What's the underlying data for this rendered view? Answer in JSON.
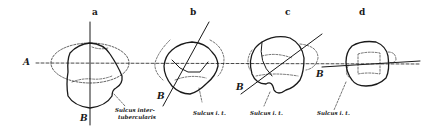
{
  "figure": {
    "panels": [
      {
        "id": "a",
        "label": "a",
        "annotation": "Sulcus inter-\ntubercularis",
        "annotation_lines": [
          "Sulcus inter-",
          "tubercularis"
        ]
      },
      {
        "id": "b",
        "label": "b",
        "annotation": "Sulcus i. t."
      },
      {
        "id": "c",
        "label": "c",
        "annotation": "Sulcus i. t."
      },
      {
        "id": "d",
        "label": "d",
        "annotation": "Sulcus i. t."
      }
    ],
    "axis_labels": {
      "horizontal": "A",
      "oblique_a": "B",
      "oblique_b": "B",
      "oblique_c": "B",
      "oblique_d": "B"
    },
    "colors": {
      "ink": "#1a1a1a",
      "background": "#ffffff"
    }
  }
}
